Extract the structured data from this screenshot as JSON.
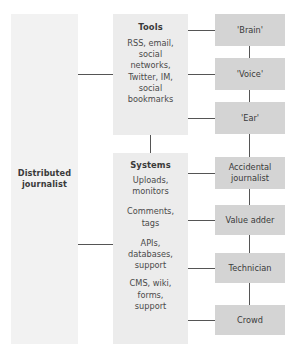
{
  "diagram": {
    "colors": {
      "left_box": "#f2f2f2",
      "mid_box": "#ececec",
      "right_box": "#d4d4d4",
      "connector": "#555555",
      "text": "#3a3a3a"
    },
    "left": {
      "label_line1": "Distributed",
      "label_line2": "journalist"
    },
    "middle": {
      "tools": {
        "heading": "Tools",
        "items": [
          "RSS, email,",
          "social",
          "networks,",
          "Twitter, IM,",
          "social",
          "bookmarks"
        ]
      },
      "systems": {
        "heading": "Systems",
        "groups": [
          {
            "lines": [
              "Uploads,",
              "monitors"
            ]
          },
          {
            "lines": [
              "Comments,",
              "tags"
            ]
          },
          {
            "lines": [
              "APIs,",
              "databases,",
              "support"
            ]
          },
          {
            "lines": [
              "CMS, wiki,",
              "forms,",
              "support"
            ]
          }
        ]
      }
    },
    "right": {
      "nodes": [
        {
          "label": "'Brain'"
        },
        {
          "label": "'Voice'"
        },
        {
          "label": "'Ear'"
        },
        {
          "label": "Accidental journalist"
        },
        {
          "label": "Value adder"
        },
        {
          "label": "Technician"
        },
        {
          "label": "Crowd"
        }
      ]
    }
  }
}
